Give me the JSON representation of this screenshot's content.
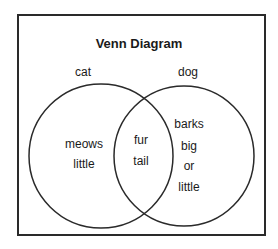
{
  "title": "Venn Diagram",
  "sets": [
    {
      "label": "cat",
      "only_items": [
        "meows",
        "little"
      ]
    },
    {
      "label": "dog",
      "only_items": [
        "barks",
        "big",
        "or",
        "little"
      ]
    }
  ],
  "intersection": [
    "fur",
    "tail"
  ],
  "colors": {
    "stroke": "#2a2a2a",
    "background": "#ffffff"
  }
}
